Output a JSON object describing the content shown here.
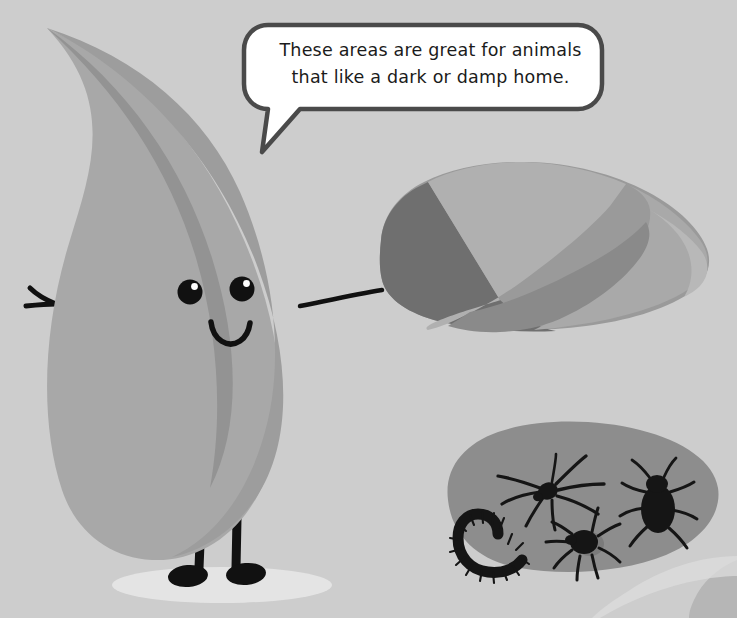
{
  "scene": {
    "title": "Leaf character beside a rock with bugs",
    "background_color": "#cdcdcd",
    "width": 737,
    "height": 618
  },
  "speech_bubble": {
    "line1": "These areas are great for animals",
    "line2": "that like a dark or damp home.",
    "fill_color": "#ffffff",
    "outline_color": "#4a4a4a"
  },
  "leaf_character": {
    "name": "leaf",
    "body_color": "#a8a8a8",
    "shade_color": "#9a9a9a",
    "vein_color": "#8f8f8f",
    "limb_color": "#111111",
    "eye_color": "#111111",
    "eye_highlight_color": "#ffffff",
    "shadow_color": "#e4e4e4"
  },
  "rock": {
    "name": "rock",
    "facets": [
      {
        "label": "top-facet",
        "color": "#9a9a9a"
      },
      {
        "label": "left-dark-facet",
        "color": "#6f6f6f"
      },
      {
        "label": "center-light-facet",
        "color": "#b5b5b5"
      },
      {
        "label": "right-facet",
        "color": "#a5a5a5"
      },
      {
        "label": "bottom-facet",
        "color": "#8a8a8a"
      }
    ]
  },
  "bug_patch": {
    "name": "bug-patch",
    "patch_color": "#8d8d8d",
    "bug_color": "#151515",
    "shadow_color": "#7b7b7b",
    "bugs": [
      {
        "name": "spider",
        "label": "Spider"
      },
      {
        "name": "beetle",
        "label": "Beetle"
      },
      {
        "name": "centipede",
        "label": "Centipede"
      },
      {
        "name": "tick",
        "label": "Tick"
      }
    ]
  },
  "corner_shape": {
    "name": "corner-blob",
    "color": "#b6b6b6"
  }
}
